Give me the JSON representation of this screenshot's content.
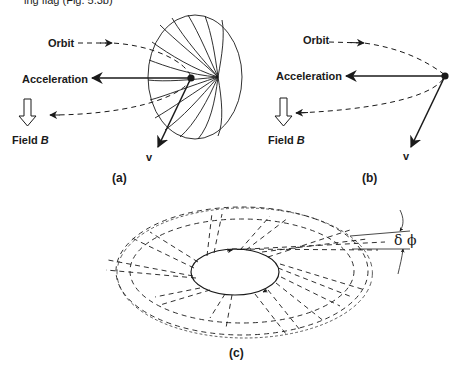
{
  "header": {
    "partial_text": "ing flag (Fig. 5.3b)"
  },
  "panel_a": {
    "caption": "(a)",
    "orbit_label": "Orbit",
    "acceleration_label": "Acceleration",
    "field_label_prefix": "Field ",
    "field_label_symbol": "B",
    "velocity_label": "v"
  },
  "panel_b": {
    "caption": "(b)",
    "orbit_label": "Orbit",
    "acceleration_label": "Acceleration",
    "field_label_prefix": "Field ",
    "field_label_symbol": "B",
    "velocity_label": "v"
  },
  "panel_c": {
    "caption": "(c)",
    "angle_label": "δ ϕ"
  },
  "colors": {
    "ink": "#1a1a1a",
    "background": "#ffffff"
  }
}
